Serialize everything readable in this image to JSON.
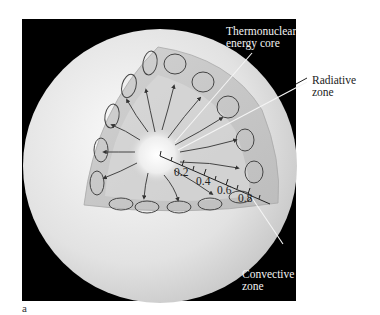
{
  "figure": {
    "panel_letter": "a",
    "background": "#000000",
    "sphere_color": "#e6e6e6",
    "wedge_color": "#c8c8c8"
  },
  "labels": {
    "core": [
      "Thermonuclear",
      "energy core"
    ],
    "radiative": [
      "Radiative",
      "zone"
    ],
    "convective": [
      "Convective",
      "zone"
    ]
  },
  "scale": {
    "ticks": [
      "0.2",
      "0.4",
      "0.6",
      "0.8"
    ]
  }
}
